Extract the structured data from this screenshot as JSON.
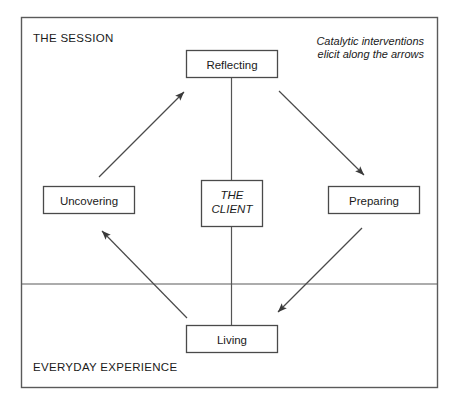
{
  "diagram": {
    "title_zone_top": "THE SESSION",
    "title_zone_bottom": "EVERYDAY EXPERIENCE",
    "annotation": {
      "line1": "Catalytic interventions",
      "line2": "elicit along the arrows"
    },
    "center_node": {
      "line1": "THE",
      "line2": "CLIENT"
    },
    "nodes": [
      {
        "id": "reflecting",
        "label": "Reflecting"
      },
      {
        "id": "uncovering",
        "label": "Uncovering"
      },
      {
        "id": "preparing",
        "label": "Preparing"
      },
      {
        "id": "living",
        "label": "Living"
      }
    ],
    "colors": {
      "frame_stroke": "#5a5a5a",
      "box_stroke": "#4a4a4a",
      "arrow_stroke": "#4a4a4a",
      "text": "#1a1a1a",
      "background": "#ffffff"
    }
  }
}
